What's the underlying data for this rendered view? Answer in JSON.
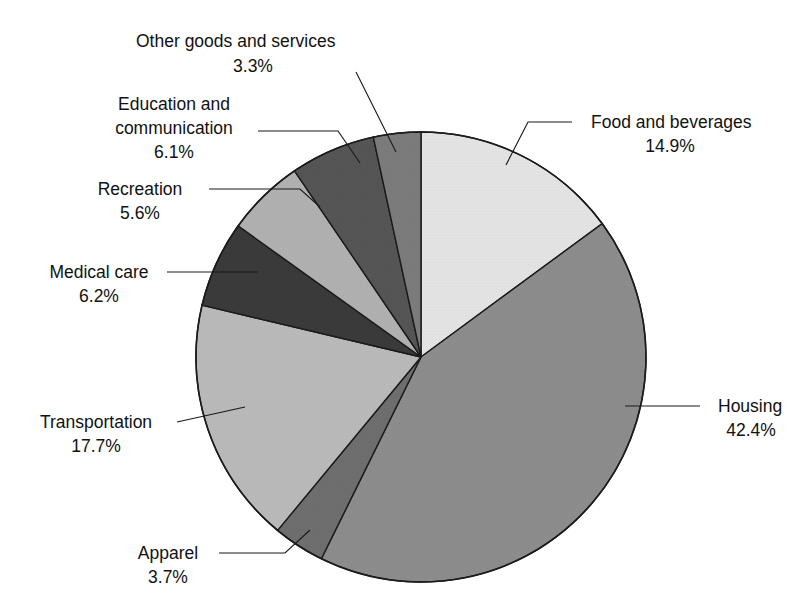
{
  "chart_data": {
    "type": "pie",
    "title": "",
    "subtitle": "",
    "xlabel": "",
    "ylabel": "",
    "legend_position": "callout-labels",
    "grid": false,
    "units": "percent",
    "start_angle_deg": 0,
    "direction": "clockwise",
    "categories": [
      "Food and beverages",
      "Housing",
      "Apparel",
      "Transportation",
      "Medical care",
      "Recreation",
      "Education and communication",
      "Other goods and services"
    ],
    "values": [
      14.9,
      42.4,
      3.7,
      17.7,
      6.2,
      5.6,
      6.1,
      3.3
    ],
    "value_labels": [
      "14.9%",
      "42.4%",
      "3.7%",
      "17.7%",
      "6.2%",
      "5.6%",
      "6.1%",
      "3.3%"
    ],
    "slice_colors": [
      "#e3e3e3",
      "#8c8c8c",
      "#6e6e6e",
      "#b9b9b9",
      "#3a3a3a",
      "#b0b0b0",
      "#555555",
      "#7b7b7b"
    ],
    "slices": [
      {
        "label": "Food and beverages",
        "value": 14.9,
        "value_label": "14.9%",
        "color": "#e3e3e3",
        "start_deg": 0.0,
        "end_deg": 53.64
      },
      {
        "label": "Housing",
        "value": 42.4,
        "value_label": "42.4%",
        "color": "#8c8c8c",
        "start_deg": 53.64,
        "end_deg": 206.28
      },
      {
        "label": "Apparel",
        "value": 3.7,
        "value_label": "3.7%",
        "color": "#6e6e6e",
        "start_deg": 206.28,
        "end_deg": 219.6
      },
      {
        "label": "Transportation",
        "value": 17.7,
        "value_label": "17.7%",
        "color": "#b9b9b9",
        "start_deg": 219.6,
        "end_deg": 283.32
      },
      {
        "label": "Medical care",
        "value": 6.2,
        "value_label": "6.2%",
        "color": "#3a3a3a",
        "start_deg": 283.32,
        "end_deg": 305.64
      },
      {
        "label": "Recreation",
        "value": 5.6,
        "value_label": "5.6%",
        "color": "#b0b0b0",
        "start_deg": 305.64,
        "end_deg": 325.8
      },
      {
        "label": "Education and communication",
        "value": 6.1,
        "value_label": "6.1%",
        "color": "#555555",
        "start_deg": 325.8,
        "end_deg": 347.76
      },
      {
        "label": "Other goods and services",
        "value": 3.3,
        "value_label": "3.3%",
        "color": "#7b7b7b",
        "start_deg": 347.76,
        "end_deg": 360.0
      }
    ]
  },
  "callouts": {
    "other_goods": {
      "line1": "Other goods and services",
      "line2": "3.3%"
    },
    "education": {
      "line1": "Education and",
      "line2": "communication",
      "line3": "6.1%"
    },
    "recreation": {
      "line1": "Recreation",
      "line2": "5.6%"
    },
    "medical": {
      "line1": "Medical care",
      "line2": "6.2%"
    },
    "transportation": {
      "line1": "Transportation",
      "line2": "17.7%"
    },
    "apparel": {
      "line1": "Apparel",
      "line2": "3.7%"
    },
    "food": {
      "line1": "Food and beverages",
      "line2": "14.9%"
    },
    "housing": {
      "line1": "Housing",
      "line2": "42.4%"
    }
  },
  "geometry": {
    "center_x": 421,
    "center_y": 357,
    "radius": 225
  }
}
